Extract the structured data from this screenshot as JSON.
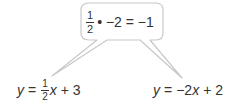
{
  "callout": {
    "numerator": "1",
    "denominator": "2",
    "expression": "• −2 = −1",
    "border_color": "#c8c8c8",
    "fill_color": "#ffffff"
  },
  "equations": [
    {
      "id": "left",
      "lhs": "y",
      "equals": "=",
      "numerator": "1",
      "denominator": "2",
      "variable": "x",
      "rest": "+ 3"
    },
    {
      "id": "right",
      "lhs": "y",
      "equals": "=",
      "coefficient": "−2",
      "variable": "x",
      "rest": "+ 2"
    }
  ]
}
